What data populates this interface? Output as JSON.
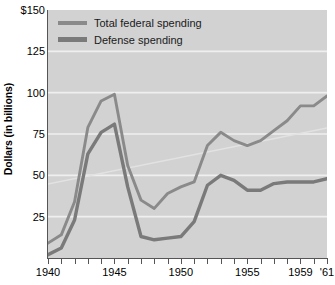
{
  "chart_data": {
    "type": "line",
    "title": "",
    "xlabel": "",
    "ylabel": "Dollars (in billions)",
    "xlim": [
      1940,
      1961
    ],
    "ylim": [
      0,
      150
    ],
    "grid": true,
    "legend_position": "top-left",
    "y_ticks": [
      {
        "value": 150,
        "label": "$150"
      },
      {
        "value": 125,
        "label": "125"
      },
      {
        "value": 100,
        "label": "100"
      },
      {
        "value": 75,
        "label": "75"
      },
      {
        "value": 50,
        "label": "50"
      },
      {
        "value": 25,
        "label": "25"
      }
    ],
    "x_ticks": [
      1940,
      1941,
      1942,
      1943,
      1944,
      1945,
      1946,
      1947,
      1948,
      1949,
      1950,
      1951,
      1952,
      1953,
      1954,
      1955,
      1956,
      1957,
      1958,
      1959,
      1960,
      1961
    ],
    "x_tick_labels": [
      {
        "value": 1940,
        "label": "1940"
      },
      {
        "value": 1945,
        "label": "1945"
      },
      {
        "value": 1950,
        "label": "1950"
      },
      {
        "value": 1955,
        "label": "1955"
      },
      {
        "value": 1959,
        "label": "1959"
      },
      {
        "value": 1961,
        "label": "'61"
      }
    ],
    "x": [
      1940,
      1941,
      1942,
      1943,
      1944,
      1945,
      1946,
      1947,
      1948,
      1949,
      1950,
      1951,
      1952,
      1953,
      1954,
      1955,
      1956,
      1957,
      1958,
      1959,
      1960,
      1961
    ],
    "series": [
      {
        "name": "Total federal spending",
        "color": "#8a8a8a",
        "values": [
          9,
          14,
          34,
          79,
          95,
          99,
          56,
          35,
          30,
          39,
          43,
          46,
          68,
          76,
          71,
          68,
          71,
          77,
          83,
          92,
          92,
          98
        ]
      },
      {
        "name": "Defense spending",
        "color": "#7a7a7a",
        "values": [
          2,
          6,
          23,
          63,
          76,
          81,
          43,
          13,
          11,
          12,
          13,
          22,
          44,
          50,
          47,
          41,
          41,
          45,
          46,
          46,
          46,
          48
        ]
      }
    ]
  },
  "legend": {
    "items": [
      {
        "label": "Total federal spending"
      },
      {
        "label": "Defense spending"
      }
    ]
  },
  "axes": {
    "y_title": "Dollars (in billions)"
  }
}
